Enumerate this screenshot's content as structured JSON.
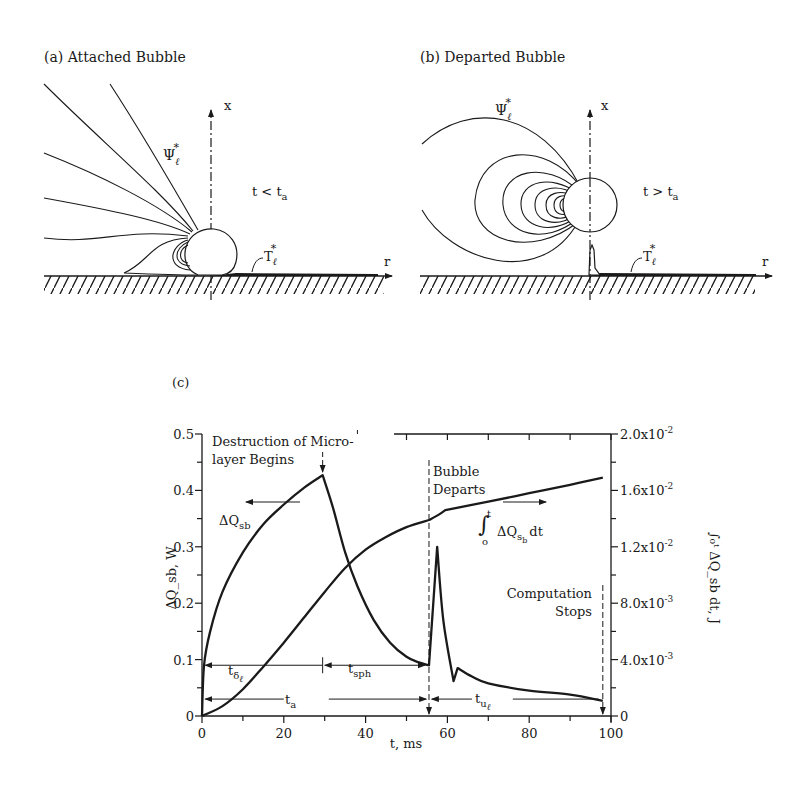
{
  "panels": {
    "a": {
      "label": "(a) Attached Bubble",
      "axis_x": "x",
      "axis_r": "r",
      "condition": "t < t",
      "condition_sub": "a",
      "psi_label": "Ψ",
      "psi_sub": "ℓ",
      "psi_sup": "*",
      "temp_label": "T",
      "temp_sub": "ℓ",
      "temp_sup": "*"
    },
    "b": {
      "label": "(b) Departed Bubble",
      "axis_x": "x",
      "axis_r": "r",
      "condition": "t > t",
      "condition_sub": "a",
      "psi_label": "Ψ",
      "psi_sub": "ℓ",
      "psi_sup": "*",
      "temp_label": "T",
      "temp_sub": "ℓ",
      "temp_sup": "*"
    },
    "c": {
      "label": "(c)"
    }
  },
  "chart_data": {
    "type": "line",
    "title": "(c)",
    "xlabel": "t, ms",
    "ylabel": "ΔQ_sb, W",
    "ylabel_right": "∫₀ᵗ ΔQ_sb dt, J",
    "xlim": [
      0,
      100
    ],
    "ylim": [
      0,
      0.5
    ],
    "ylim_right": [
      0,
      0.02
    ],
    "x_ticks": [
      "0",
      "20",
      "40",
      "60",
      "80",
      "100"
    ],
    "y_ticks": [
      "0",
      "0.1",
      "0.2",
      "0.3",
      "0.4",
      "0.5"
    ],
    "y_ticks_right": [
      "0",
      "4.0x10",
      "8.0x10",
      "1.2x10",
      "1.6x10",
      "2.0x10"
    ],
    "y_ticks_right_exp": [
      "",
      "-3",
      "-3",
      "-2",
      "-2",
      "-2"
    ],
    "grid": false,
    "series": [
      {
        "name": "ΔQ_sb",
        "axis": "left",
        "x": [
          0,
          0.5,
          2,
          5,
          10,
          15,
          20,
          25,
          29.5,
          32,
          35,
          38,
          42,
          46,
          50,
          53,
          55.5,
          57.5,
          59,
          61.5,
          62.5,
          66,
          70,
          80,
          90,
          98
        ],
        "y": [
          0,
          0.09,
          0.15,
          0.22,
          0.29,
          0.34,
          0.375,
          0.405,
          0.427,
          0.37,
          0.29,
          0.23,
          0.17,
          0.13,
          0.105,
          0.095,
          0.09,
          0.3,
          0.17,
          0.062,
          0.085,
          0.07,
          0.058,
          0.045,
          0.038,
          0.027
        ]
      },
      {
        "name": "∫₀ᵗ ΔQ_sb dt",
        "axis": "right",
        "x": [
          0,
          5,
          10,
          15,
          20,
          25,
          30,
          35,
          40,
          45,
          50,
          55.5,
          58,
          59.5,
          70,
          80,
          90,
          98
        ],
        "y": [
          0,
          0.0007,
          0.0019,
          0.0035,
          0.0052,
          0.007,
          0.0088,
          0.0105,
          0.0118,
          0.0127,
          0.0134,
          0.0139,
          0.0143,
          0.0146,
          0.0152,
          0.0158,
          0.0164,
          0.0169
        ]
      }
    ],
    "events": {
      "microlayer_destruction_t": 29.5,
      "bubble_departs_t": 55.5,
      "computation_stops_t": 98
    },
    "intervals": [
      {
        "name": "t_δℓ",
        "from": 0,
        "to": 29.5,
        "level": 0.09
      },
      {
        "name": "t_sph",
        "from": 29.5,
        "to": 55.5,
        "level": 0.09
      },
      {
        "name": "t_a",
        "from": 0,
        "to": 55.5,
        "level": 0.03
      },
      {
        "name": "t_uℓ",
        "from": 55.5,
        "to": 98,
        "level": 0.03
      }
    ],
    "annotations": {
      "destruction_line1": "Destruction of Micro-",
      "destruction_line2": "layer Begins",
      "departs_line1": "Bubble",
      "departs_line2": "Departs",
      "stops_line1": "Computation",
      "stops_line2": "Stops",
      "dq_label": "ΔQ",
      "dq_sub": "sb",
      "integral_label": "ΔQ",
      "integral_sub": "s",
      "integral_subsub": "b",
      "integral_dt": "dt",
      "integral_lower": "o",
      "integral_upper": "t",
      "t_delta": "t",
      "t_delta_sub": "δ",
      "t_delta_subsub": "ℓ",
      "t_sph": "t",
      "t_sph_sub": "sph",
      "t_a": "t",
      "t_a_sub": "a",
      "t_u": "t",
      "t_u_sub": "u",
      "t_u_subsub": "ℓ"
    }
  }
}
